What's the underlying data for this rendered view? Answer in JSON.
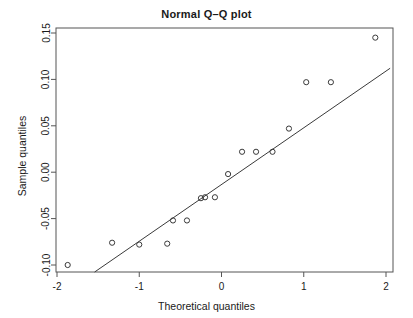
{
  "chart_data": {
    "type": "scatter",
    "title_display": "Normal Q–Q plot",
    "xlabel": "Theoretical quantiles",
    "ylabel": "Sample quantiles",
    "grid": false,
    "legend": null,
    "xlim": [
      -2.05,
      2.05
    ],
    "ylim": [
      -0.108,
      0.157
    ],
    "xticks": [
      -2,
      -1,
      0,
      1,
      2
    ],
    "xtick_labels": [
      "-2",
      "-1",
      "0",
      "1",
      "2"
    ],
    "yticks": [
      0.15,
      0.1,
      0.05,
      0.0,
      -0.05,
      -0.1
    ],
    "ytick_labels": [
      "0.15",
      "0.10",
      "0.05",
      "0.00",
      "-0.05",
      "-0.10"
    ],
    "marker": "open-circle",
    "point_color": "#3a3a3a",
    "line_color": "#3a3a3a",
    "axis_color": "#555555",
    "n_points": 17,
    "x": [
      -1.87,
      -1.33,
      -1.0,
      -0.66,
      -0.59,
      -0.42,
      -0.25,
      -0.2,
      -0.08,
      0.08,
      0.25,
      0.42,
      0.62,
      0.82,
      1.03,
      1.33,
      1.87
    ],
    "y": [
      -0.1,
      -0.076,
      -0.078,
      -0.077,
      -0.052,
      -0.052,
      -0.028,
      -0.027,
      -0.027,
      -0.002,
      0.022,
      0.022,
      0.022,
      0.047,
      0.097,
      0.097,
      0.145
    ],
    "points": [
      {
        "x": -1.87,
        "y": -0.1
      },
      {
        "x": -1.33,
        "y": -0.076
      },
      {
        "x": -1.0,
        "y": -0.078
      },
      {
        "x": -0.66,
        "y": -0.077
      },
      {
        "x": -0.59,
        "y": -0.052
      },
      {
        "x": -0.42,
        "y": -0.052
      },
      {
        "x": -0.25,
        "y": -0.028
      },
      {
        "x": -0.2,
        "y": -0.027
      },
      {
        "x": -0.08,
        "y": -0.027
      },
      {
        "x": 0.08,
        "y": -0.002
      },
      {
        "x": 0.25,
        "y": 0.022
      },
      {
        "x": 0.42,
        "y": 0.022
      },
      {
        "x": 0.62,
        "y": 0.022
      },
      {
        "x": 0.82,
        "y": 0.047
      },
      {
        "x": 1.03,
        "y": 0.097
      },
      {
        "x": 1.33,
        "y": 0.097
      },
      {
        "x": 1.87,
        "y": 0.145
      }
    ],
    "reference_line": {
      "label": "qqline",
      "x_start": -1.55,
      "y_start": -0.108,
      "x_end": 2.05,
      "y_end": 0.112,
      "slope": 0.0611,
      "intercept": -0.0133
    }
  }
}
